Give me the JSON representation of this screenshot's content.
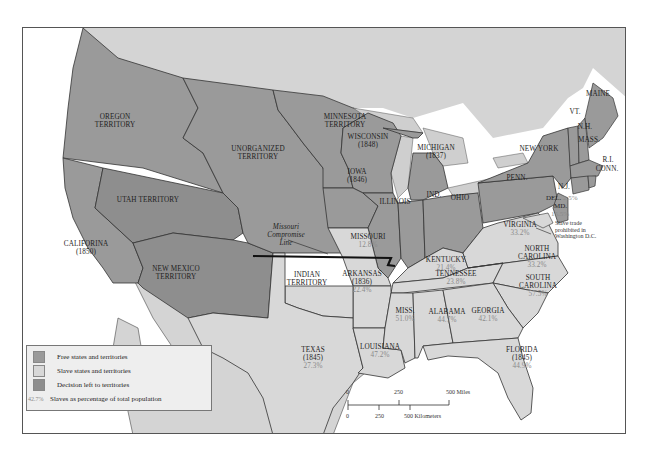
{
  "map": {
    "legend": {
      "items": [
        {
          "label": "Free states and territories",
          "color": "#9a9a9a"
        },
        {
          "label": "Slave states and territories",
          "color": "#d8d8d8"
        },
        {
          "label": "Decision left to territories",
          "color": "#8e8e8e"
        }
      ],
      "pct_sample": "42.7%",
      "pct_label": "Slaves as percentage of total population"
    },
    "regions": {
      "oregon": {
        "name": "OREGON",
        "name2": "TERRITORY"
      },
      "unorganized": {
        "name": "UNORGANIZED",
        "name2": "TERRITORY"
      },
      "minnesota": {
        "name": "MINNESOTA",
        "name2": "TERRITORY"
      },
      "utah": {
        "name": "UTAH TERRITORY"
      },
      "california": {
        "name": "CALIFORINA",
        "year": "(1850)"
      },
      "new_mexico": {
        "name": "NEW MEXICO",
        "name2": "TERRITORY"
      },
      "wisconsin": {
        "name": "WISCONSIN",
        "year": "(1848)"
      },
      "iowa": {
        "name": "IOWA",
        "year": "(1846)"
      },
      "michigan": {
        "name": "MICHIGAN",
        "year": "(1837)"
      },
      "illinois": {
        "name": "ILLINOIS"
      },
      "indiana": {
        "name": "IND."
      },
      "ohio": {
        "name": "OHIO"
      },
      "penn": {
        "name": "PENN."
      },
      "new_york": {
        "name": "NEW YORK"
      },
      "maine": {
        "name": "MAINE"
      },
      "vt": {
        "name": "VT."
      },
      "nh": {
        "name": "N.H."
      },
      "mass": {
        "name": "MASS."
      },
      "ri": {
        "name": "R.I."
      },
      "conn": {
        "name": "CONN."
      },
      "nj": {
        "name": "N.J."
      },
      "del": {
        "name": "DEL.",
        "pct": "2.5%"
      },
      "md": {
        "name": "MD.",
        "pct": "15.5%"
      },
      "dc_note": {
        "line1": "Slave trade",
        "line2": "prohibited in",
        "line3": "Washington D.C."
      },
      "missouri": {
        "name": "MISSOURI",
        "pct": "12.8%"
      },
      "kentucky": {
        "name": "KENTUCKY",
        "pct": "21.4%"
      },
      "virginia": {
        "name": "VIRGINIA",
        "pct": "33.2%"
      },
      "north_carolina": {
        "name": "NORTH",
        "name2": "CAROLINA",
        "pct": "33.2%"
      },
      "tennessee": {
        "name": "TENNESSEE",
        "pct": "23.8%"
      },
      "arkansas": {
        "name": "ARKANSAS",
        "year": "(1836)",
        "pct": "22.4%"
      },
      "indian_territory": {
        "name": "INDIAN",
        "name2": "TERRITORY"
      },
      "south_carolina": {
        "name": "SOUTH",
        "name2": "CAROLINA",
        "pct": "57.5%"
      },
      "mississippi": {
        "name": "MISS.",
        "pct": "51.0%"
      },
      "alabama": {
        "name": "ALABAMA",
        "pct": "44.7%"
      },
      "georgia": {
        "name": "GEORGIA",
        "pct": "42.1%"
      },
      "louisiana": {
        "name": "LOUISIANA",
        "pct": "47.2%"
      },
      "florida": {
        "name": "FLORIDA",
        "year": "(1845)",
        "pct": "44.9%"
      },
      "texas": {
        "name": "TEXAS",
        "year": "(1845)",
        "pct": "27.3%"
      }
    },
    "compromise_line": {
      "line1": "Missouri",
      "line2": "Compromise",
      "line3": "Line"
    },
    "scale": {
      "miles": [
        "0",
        "250",
        "500 Miles"
      ],
      "km": [
        "0",
        "250",
        "500 Kilometers"
      ]
    },
    "colors": {
      "free": "#9a9a9a",
      "slave": "#d8d8d8",
      "territory_decision": "#8e8e8e",
      "foreign_land": "#d4d4d4",
      "water": "#ffffff",
      "lakes": "#cfcfcf",
      "border": "#333333",
      "pct_text": "#8a8a8a"
    }
  }
}
